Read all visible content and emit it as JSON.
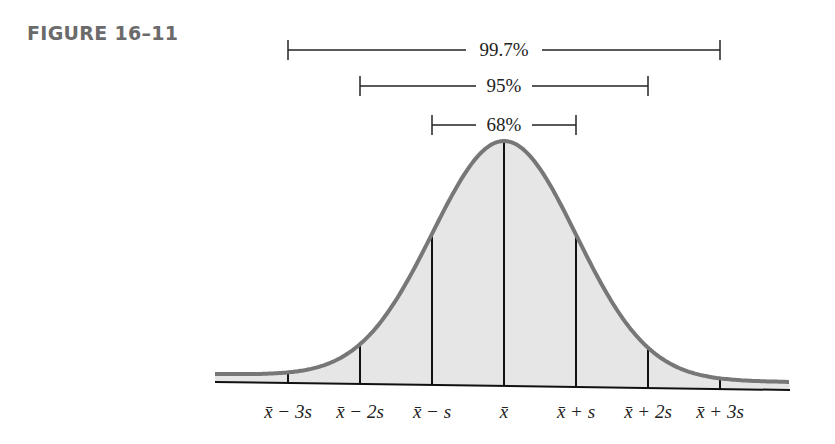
{
  "figure_label": "FIGURE 16–11",
  "chart_data": {
    "type": "area",
    "xlabel": "",
    "ylabel": "",
    "grid": false,
    "tick_labels": [
      "x̄ − 3s",
      "x̄ − 2s",
      "x̄ − s",
      "x̄",
      "x̄ + s",
      "x̄ + 2s",
      "x̄ + 3s"
    ],
    "tick_positions_sd": [
      -3,
      -2,
      -1,
      0,
      1,
      2,
      3
    ],
    "intervals": [
      {
        "label": "68%",
        "from_sd": -1,
        "to_sd": 1,
        "value": 68
      },
      {
        "label": "95%",
        "from_sd": -2,
        "to_sd": 2,
        "value": 95
      },
      {
        "label": "99.7%",
        "from_sd": -3,
        "to_sd": 3,
        "value": 99.7
      }
    ],
    "colors": {
      "curve": "#777777",
      "fill": "#e6e6e6",
      "lines": "#111111"
    }
  }
}
